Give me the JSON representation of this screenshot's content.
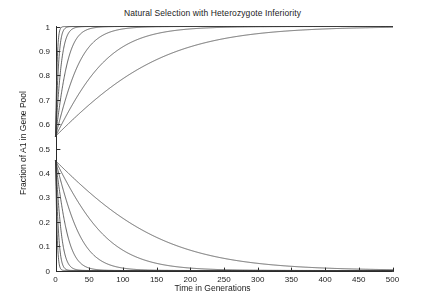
{
  "chart_data": {
    "type": "line",
    "title": "Natural Selection with Heterozygote Inferiority",
    "xlabel": "Time in Generations",
    "ylabel": "Fraction of A1 in Gene Pool",
    "xlim": [
      0,
      500
    ],
    "ylim": [
      0,
      1
    ],
    "xticks": [
      0,
      50,
      100,
      150,
      200,
      250,
      300,
      350,
      400,
      450,
      500
    ],
    "yticks": [
      0,
      0.1,
      0.2,
      0.3,
      0.4,
      0.5,
      0.6,
      0.7,
      0.8,
      0.9,
      1
    ],
    "grid": false,
    "legend": false,
    "line_color": "#3c3c3c",
    "series": [
      {
        "name": "upper-1",
        "start": 0.55,
        "end": 1,
        "rate": 0.62,
        "midpoint": 2
      },
      {
        "name": "upper-2",
        "start": 0.55,
        "end": 1,
        "rate": 0.33,
        "midpoint": 4
      },
      {
        "name": "upper-3",
        "start": 0.55,
        "end": 1,
        "rate": 0.175,
        "midpoint": 8
      },
      {
        "name": "upper-4",
        "start": 0.55,
        "end": 1,
        "rate": 0.088,
        "midpoint": 16
      },
      {
        "name": "upper-5",
        "start": 0.55,
        "end": 1,
        "rate": 0.044,
        "midpoint": 33
      },
      {
        "name": "upper-6",
        "start": 0.55,
        "end": 1,
        "rate": 0.022,
        "midpoint": 66
      },
      {
        "name": "upper-7",
        "start": 0.55,
        "end": 1,
        "rate": 0.011,
        "midpoint": 132
      },
      {
        "name": "lower-1",
        "start": 0.45,
        "end": 0,
        "rate": 0.62,
        "midpoint": 2
      },
      {
        "name": "lower-2",
        "start": 0.45,
        "end": 0,
        "rate": 0.33,
        "midpoint": 4
      },
      {
        "name": "lower-3",
        "start": 0.45,
        "end": 0,
        "rate": 0.175,
        "midpoint": 8
      },
      {
        "name": "lower-4",
        "start": 0.45,
        "end": 0,
        "rate": 0.088,
        "midpoint": 16
      },
      {
        "name": "lower-5",
        "start": 0.45,
        "end": 0,
        "rate": 0.044,
        "midpoint": 33
      },
      {
        "name": "lower-6",
        "start": 0.45,
        "end": 0,
        "rate": 0.022,
        "midpoint": 66
      },
      {
        "name": "lower-7",
        "start": 0.45,
        "end": 0,
        "rate": 0.011,
        "midpoint": 132
      }
    ],
    "annotations": {
      "upper_start_value": 0.55,
      "lower_start_value": 0.45,
      "upper_fixation_value": 1,
      "lower_fixation_value": 0,
      "curve_count_upper": 7,
      "curve_count_lower": 7
    }
  }
}
